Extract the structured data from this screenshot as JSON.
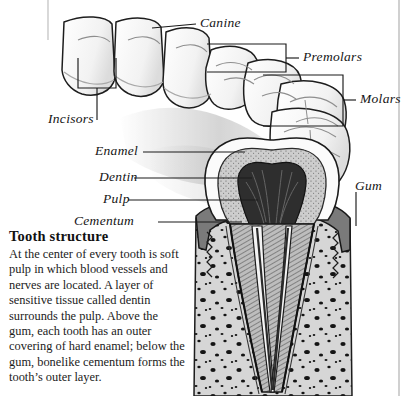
{
  "figure": {
    "tooth_labels": [
      {
        "id": "incisors",
        "text": "Incisors"
      },
      {
        "id": "canine",
        "text": "Canine"
      },
      {
        "id": "premolars",
        "text": "Premolars"
      },
      {
        "id": "molars",
        "text": "Molars"
      }
    ],
    "structure_labels": [
      {
        "id": "enamel",
        "text": "Enamel"
      },
      {
        "id": "dentin",
        "text": "Dentin"
      },
      {
        "id": "pulp",
        "text": "Pulp"
      },
      {
        "id": "cementum",
        "text": "Cementum"
      },
      {
        "id": "gum",
        "text": "Gum"
      }
    ]
  },
  "caption": {
    "heading": "Tooth structure",
    "body": "At the center of every tooth is soft pulp in which blood vessels and nerves are located. A layer of sensitive tissue called dentin surrounds the pulp. Above the gum, each tooth has an outer covering of hard enamel; below the gum, bonelike cementum forms the tooth’s outer layer."
  },
  "colors": {
    "ink": "#141414",
    "enamel": "#fdfdfd",
    "dentin": "#c9c9c9",
    "pulp": "#3a3a3a",
    "gum": "#7d7d7d",
    "bone": "#d2d2d2",
    "page": "#ffffff"
  }
}
